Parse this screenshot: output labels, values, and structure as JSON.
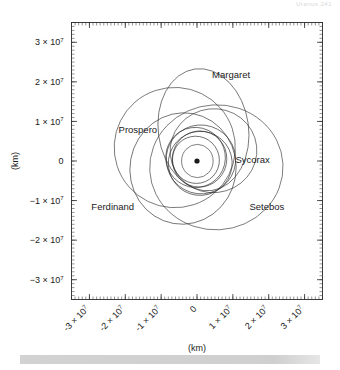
{
  "header": {
    "text": "Uranus    241"
  },
  "axes": {
    "x_title": "(km)",
    "y_title": "(km)",
    "x_tick_labels": [
      "-3 × 10",
      "-2 × 10",
      "-1 × 10",
      "0",
      "1 × 10",
      "2 × 10",
      "3 × 10"
    ],
    "y_tick_labels": [
      "3 × 10",
      "2 × 10",
      "1 × 10",
      "0",
      "−1 × 10",
      "−2 × 10",
      "−3 × 10"
    ],
    "exponent": "7",
    "x_tick_rotation_deg": -45,
    "minor_ticks_per_major": 10
  },
  "chart_data": {
    "type": "scatter",
    "title": "",
    "subtitle": "",
    "xlabel": "(km)",
    "ylabel": "(km)",
    "xlim": [
      -35000000,
      35000000
    ],
    "ylim": [
      -35000000,
      35000000
    ],
    "xticks": [
      -30000000,
      -20000000,
      -10000000,
      0,
      10000000,
      20000000,
      30000000
    ],
    "yticks": [
      -30000000,
      -20000000,
      -10000000,
      0,
      10000000,
      20000000,
      30000000
    ],
    "grid": false,
    "legend_position": "none",
    "units": "km",
    "center_marker": {
      "name": "Uranus",
      "x": 0,
      "y": 0,
      "radius_px": 2.6
    },
    "annotations": [
      {
        "label": "Margaret",
        "x": 9500000,
        "y": 21000000
      },
      {
        "label": "Prospero",
        "x": -16500000,
        "y": 7200000
      },
      {
        "label": "Sycorax",
        "x": 15500000,
        "y": -500000
      },
      {
        "label": "Ferdinand",
        "x": -23500000,
        "y": -12300000
      },
      {
        "label": "Setebos",
        "x": 19500000,
        "y": -12300000
      }
    ],
    "series": [
      {
        "name": "Margaret",
        "semi_major_axis": 14100000,
        "eccentricity": 0.66,
        "orbit_ellipse": {
          "cx": 1800000,
          "cy": 7900000,
          "rx": 12600000,
          "ry": 15500000,
          "rotation_deg": -8
        }
      },
      {
        "name": "Prospero",
        "semi_major_axis": 16200000,
        "eccentricity": 0.32,
        "orbit_ellipse": {
          "cx": -6200000,
          "cy": 3400000,
          "rx": 16900000,
          "ry": 15200000,
          "rotation_deg": 4
        }
      },
      {
        "name": "Setebos",
        "semi_major_axis": 17400000,
        "eccentricity": 0.52,
        "orbit_ellipse": {
          "cx": 5400000,
          "cy": -1600000,
          "rx": 18600000,
          "ry": 15800000,
          "rotation_deg": -3
        }
      },
      {
        "name": "Ferdinand",
        "semi_major_axis": 20400000,
        "eccentricity": 0.4,
        "orbit_ellipse": {
          "cx": -3900000,
          "cy": -1900000,
          "rx": 14800000,
          "ry": 14100000,
          "rotation_deg": 10
        }
      },
      {
        "name": "Sycorax",
        "semi_major_axis": 12200000,
        "eccentricity": 0.52,
        "orbit_ellipse": {
          "cx": 4600000,
          "cy": 2600000,
          "rx": 12100000,
          "ry": 10600000,
          "rotation_deg": -6
        }
      },
      {
        "name": "Caliban",
        "semi_major_axis": 7230000,
        "eccentricity": 0.16,
        "orbit_ellipse": {
          "cx": 700000,
          "cy": 500000,
          "rx": 7600000,
          "ry": 7100000,
          "rotation_deg": 12
        }
      },
      {
        "name": "Stephano",
        "semi_major_axis": 8000000,
        "eccentricity": 0.23,
        "orbit_ellipse": {
          "cx": -400000,
          "cy": 900000,
          "rx": 8300000,
          "ry": 7600000,
          "rotation_deg": -20
        }
      },
      {
        "name": "Trinculo",
        "semi_major_axis": 8500000,
        "eccentricity": 0.22,
        "orbit_ellipse": {
          "cx": 900000,
          "cy": -600000,
          "rx": 8900000,
          "ry": 8100000,
          "rotation_deg": 30
        }
      },
      {
        "name": "Francisco",
        "semi_major_axis": 4280000,
        "eccentricity": 0.13,
        "orbit_ellipse": {
          "cx": 100000,
          "cy": 0,
          "rx": 4400000,
          "ry": 4200000,
          "rotation_deg": 0
        }
      },
      {
        "name": "Inner-orbit-A",
        "semi_major_axis": 6300000,
        "eccentricity": 0.18,
        "orbit_ellipse": {
          "cx": -300000,
          "cy": 300000,
          "rx": 6500000,
          "ry": 6000000,
          "rotation_deg": -35
        }
      },
      {
        "name": "Inner-orbit-B",
        "semi_major_axis": 9300000,
        "eccentricity": 0.25,
        "orbit_ellipse": {
          "cx": 1100000,
          "cy": 400000,
          "rx": 9700000,
          "ry": 8700000,
          "rotation_deg": 18
        }
      }
    ]
  }
}
